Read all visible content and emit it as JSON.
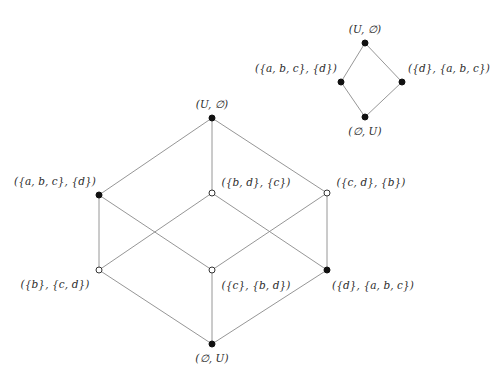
{
  "figure": {
    "width": 501,
    "height": 382,
    "background": "#ffffff",
    "edge_color": "#8a8a8a",
    "node_fill_color": "#111111",
    "node_hollow_color": "#ffffff",
    "label_color": "#2b2b2b"
  },
  "diagrams": [
    {
      "id": "small-diamond",
      "name": "upper-right-diamond",
      "nodes": [
        {
          "id": "sd-top",
          "label": "(U, ∅)",
          "x": 365,
          "y": 43,
          "style": "filled",
          "label_x": 365,
          "label_y": 29,
          "label_anchor": "center"
        },
        {
          "id": "sd-left",
          "label": "({a, b, c}, {d})",
          "x": 341,
          "y": 82,
          "style": "filled",
          "label_x": 296,
          "label_y": 68,
          "label_anchor": "center"
        },
        {
          "id": "sd-right",
          "label": "({d}, {a, b, c})",
          "x": 402,
          "y": 82,
          "style": "filled",
          "label_x": 449,
          "label_y": 68,
          "label_anchor": "center"
        },
        {
          "id": "sd-bottom",
          "label": "(∅, U)",
          "x": 365,
          "y": 117,
          "style": "filled",
          "label_x": 365,
          "label_y": 131,
          "label_anchor": "center"
        }
      ],
      "edges": [
        {
          "from": "sd-top",
          "to": "sd-left"
        },
        {
          "from": "sd-top",
          "to": "sd-right"
        },
        {
          "from": "sd-left",
          "to": "sd-bottom"
        },
        {
          "from": "sd-right",
          "to": "sd-bottom"
        }
      ]
    },
    {
      "id": "large-cube",
      "name": "lower-left-cube",
      "nodes": [
        {
          "id": "lc-top",
          "label": "(U, ∅)",
          "x": 212,
          "y": 118,
          "style": "filled",
          "label_x": 212,
          "label_y": 104,
          "label_anchor": "center"
        },
        {
          "id": "lc-abc-d",
          "label": "({a, b, c}, {d})",
          "x": 99,
          "y": 195,
          "style": "filled",
          "label_x": 55,
          "label_y": 181,
          "label_anchor": "center"
        },
        {
          "id": "lc-bd-c",
          "label": "({b, d}, {c})",
          "x": 212,
          "y": 193,
          "style": "hollow",
          "label_x": 256,
          "label_y": 182,
          "label_anchor": "center"
        },
        {
          "id": "lc-cd-b",
          "label": "({c, d}, {b})",
          "x": 327,
          "y": 193,
          "style": "hollow",
          "label_x": 371,
          "label_y": 182,
          "label_anchor": "center"
        },
        {
          "id": "lc-b-cd",
          "label": "({b}, {c, d})",
          "x": 99,
          "y": 270,
          "style": "hollow",
          "label_x": 55,
          "label_y": 284,
          "label_anchor": "center"
        },
        {
          "id": "lc-c-bd",
          "label": "({c}, {b, d})",
          "x": 212,
          "y": 270,
          "style": "hollow",
          "label_x": 256,
          "label_y": 285,
          "label_anchor": "center"
        },
        {
          "id": "lc-d-abc",
          "label": "({d}, {a, b, c})",
          "x": 327,
          "y": 270,
          "style": "filled",
          "label_x": 373,
          "label_y": 285,
          "label_anchor": "center"
        },
        {
          "id": "lc-bottom",
          "label": "(∅, U)",
          "x": 212,
          "y": 344,
          "style": "filled",
          "label_x": 212,
          "label_y": 358,
          "label_anchor": "center"
        }
      ],
      "edges": [
        {
          "from": "lc-top",
          "to": "lc-abc-d"
        },
        {
          "from": "lc-top",
          "to": "lc-bd-c"
        },
        {
          "from": "lc-top",
          "to": "lc-cd-b"
        },
        {
          "from": "lc-abc-d",
          "to": "lc-b-cd"
        },
        {
          "from": "lc-abc-d",
          "to": "lc-c-bd"
        },
        {
          "from": "lc-bd-c",
          "to": "lc-b-cd"
        },
        {
          "from": "lc-bd-c",
          "to": "lc-d-abc"
        },
        {
          "from": "lc-cd-b",
          "to": "lc-c-bd"
        },
        {
          "from": "lc-cd-b",
          "to": "lc-d-abc"
        },
        {
          "from": "lc-b-cd",
          "to": "lc-bottom"
        },
        {
          "from": "lc-c-bd",
          "to": "lc-bottom"
        },
        {
          "from": "lc-d-abc",
          "to": "lc-bottom"
        }
      ]
    }
  ]
}
